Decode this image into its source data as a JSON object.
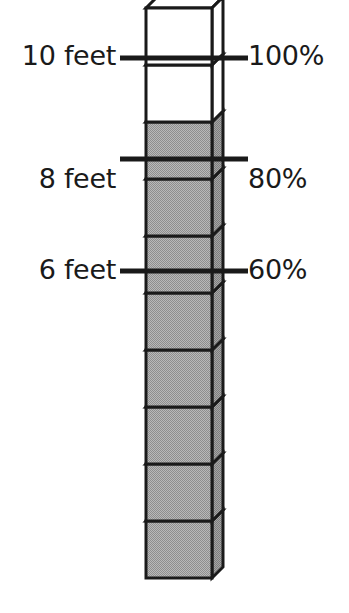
{
  "figure": {
    "title": "",
    "background_color": "#ffffff"
  },
  "colors": {
    "outline": "#1a1a1a",
    "cube_front_fill": "#a9a9a9",
    "cube_top_fill": "#b4b4b4",
    "cube_side_fill": "#969696",
    "cube_empty_fill": "#ffffff",
    "tick_line": "#1a1a1a",
    "text": "#1a1a1a"
  },
  "chart_data": {
    "type": "bar",
    "title": "",
    "xlabel": "",
    "ylabel": "",
    "orientation": "vertical",
    "unit_left": "feet",
    "unit_right": "%",
    "total_units": 10,
    "filled_units": 8,
    "empty_units": 2,
    "feet_per_unit": 1,
    "percent_per_unit": 10,
    "ylim": [
      0,
      10
    ],
    "grid": false,
    "legend": null,
    "categories": [
      "stack"
    ],
    "values": [
      8
    ],
    "series": [
      {
        "name": "filled cubes",
        "values": [
          8
        ]
      },
      {
        "name": "empty cubes",
        "values": [
          2
        ]
      }
    ],
    "ticks": [
      {
        "feet": 10,
        "percent": 100,
        "left_label": "10 feet",
        "right_label": "100%",
        "y": 58
      },
      {
        "feet": 8,
        "percent": 80,
        "left_label": "8 feet",
        "right_label": "80%",
        "y": 159
      },
      {
        "feet": 6,
        "percent": 60,
        "left_label": "6 feet",
        "right_label": "60%",
        "y": 271
      }
    ],
    "cubes": [
      {
        "index": 10,
        "filled": false
      },
      {
        "index": 9,
        "filled": false
      },
      {
        "index": 8,
        "filled": true
      },
      {
        "index": 7,
        "filled": true
      },
      {
        "index": 6,
        "filled": true
      },
      {
        "index": 5,
        "filled": true
      },
      {
        "index": 4,
        "filled": true
      },
      {
        "index": 3,
        "filled": true
      },
      {
        "index": 2,
        "filled": true
      },
      {
        "index": 1,
        "filled": true
      }
    ]
  },
  "labels": {
    "tick_10_left": "10 feet",
    "tick_10_right": "100%",
    "tick_8_left": "8 feet",
    "tick_8_right": "80%",
    "tick_6_left": "6 feet",
    "tick_6_right": "60%"
  },
  "geometry": {
    "front_left_x": 146,
    "front_right_x": 212,
    "depth_dx": 11,
    "depth_dy": 11,
    "bottom_y": 578,
    "cube_height": 57,
    "tick_left_x": 120,
    "tick_right_x": 248
  }
}
